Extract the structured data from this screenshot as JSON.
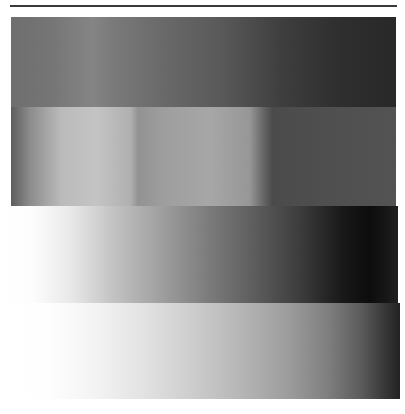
{
  "image": {
    "title": "Grayscale gradient test pattern",
    "width": 405,
    "height": 414,
    "background_color": "#ffffff",
    "type": "grayscale-gradient-bands",
    "band_count": 4,
    "rule": {
      "name": "top-horizontal-rule",
      "color": "#3a3a3a",
      "x": 10,
      "y": 5,
      "width": 387,
      "height": 2
    }
  },
  "chart_data": {
    "type": "heatmap",
    "subtitle": "Four horizontal luminance ramp bands",
    "xlabel": "",
    "ylabel": "",
    "grid": false,
    "legend": "none",
    "xlim": [
      0,
      405
    ],
    "ylim": [
      0,
      414
    ],
    "colormap": "grayscale",
    "value_range": [
      0,
      255
    ],
    "note": "Values are 8-bit luminance sampled left-to-right across each band.",
    "bands": [
      {
        "name": "band-1",
        "index": 1,
        "x": 11,
        "y": 17,
        "width": 385,
        "height": 90,
        "direction": "horizontal",
        "stops": [
          {
            "pos_pct": 0,
            "x": 11,
            "gray": 110,
            "hex": "#6e6e6e"
          },
          {
            "pos_pct": 10,
            "x": 50,
            "gray": 116,
            "hex": "#747474"
          },
          {
            "pos_pct": 21,
            "x": 92,
            "gray": 132,
            "hex": "#848484"
          },
          {
            "pos_pct": 26,
            "x": 110,
            "gray": 122,
            "hex": "#7a7a7a"
          },
          {
            "pos_pct": 40,
            "x": 165,
            "gray": 104,
            "hex": "#686868"
          },
          {
            "pos_pct": 55,
            "x": 223,
            "gray": 88,
            "hex": "#585858"
          },
          {
            "pos_pct": 70,
            "x": 280,
            "gray": 62,
            "hex": "#3e3e3e"
          },
          {
            "pos_pct": 85,
            "x": 338,
            "gray": 46,
            "hex": "#2e2e2e"
          },
          {
            "pos_pct": 100,
            "x": 396,
            "gray": 40,
            "hex": "#282828"
          }
        ]
      },
      {
        "name": "band-2",
        "index": 2,
        "x": 11,
        "y": 107,
        "width": 385,
        "height": 99,
        "direction": "horizontal",
        "stops": [
          {
            "pos_pct": 0,
            "x": 11,
            "gray": 92,
            "hex": "#5c5c5c"
          },
          {
            "pos_pct": 5,
            "x": 30,
            "gray": 140,
            "hex": "#8c8c8c"
          },
          {
            "pos_pct": 13,
            "x": 61,
            "gray": 186,
            "hex": "#bababa"
          },
          {
            "pos_pct": 22,
            "x": 96,
            "gray": 196,
            "hex": "#c4c4c4"
          },
          {
            "pos_pct": 31,
            "x": 131,
            "gray": 176,
            "hex": "#b0b0b0"
          },
          {
            "pos_pct": 33,
            "x": 138,
            "gray": 146,
            "hex": "#929292"
          },
          {
            "pos_pct": 40,
            "x": 165,
            "gray": 158,
            "hex": "#9e9e9e"
          },
          {
            "pos_pct": 52,
            "x": 211,
            "gray": 166,
            "hex": "#a6a6a6"
          },
          {
            "pos_pct": 62,
            "x": 250,
            "gray": 150,
            "hex": "#969696"
          },
          {
            "pos_pct": 66,
            "x": 265,
            "gray": 96,
            "hex": "#606060"
          },
          {
            "pos_pct": 68,
            "x": 273,
            "gray": 74,
            "hex": "#4a4a4a"
          },
          {
            "pos_pct": 80,
            "x": 319,
            "gray": 78,
            "hex": "#4e4e4e"
          },
          {
            "pos_pct": 100,
            "x": 396,
            "gray": 82,
            "hex": "#525252"
          }
        ]
      },
      {
        "name": "band-3",
        "index": 3,
        "x": 0,
        "y": 206,
        "width": 398,
        "height": 97,
        "direction": "horizontal",
        "stops": [
          {
            "pos_pct": 0,
            "x": 0,
            "gray": 255,
            "hex": "#ffffff"
          },
          {
            "pos_pct": 8,
            "x": 32,
            "gray": 253,
            "hex": "#fdfdfd"
          },
          {
            "pos_pct": 18,
            "x": 72,
            "gray": 232,
            "hex": "#e8e8e8"
          },
          {
            "pos_pct": 28,
            "x": 111,
            "gray": 196,
            "hex": "#c4c4c4"
          },
          {
            "pos_pct": 40,
            "x": 159,
            "gray": 160,
            "hex": "#a0a0a0"
          },
          {
            "pos_pct": 52,
            "x": 207,
            "gray": 124,
            "hex": "#7c7c7c"
          },
          {
            "pos_pct": 64,
            "x": 255,
            "gray": 92,
            "hex": "#5c5c5c"
          },
          {
            "pos_pct": 76,
            "x": 302,
            "gray": 58,
            "hex": "#3a3a3a"
          },
          {
            "pos_pct": 86,
            "x": 342,
            "gray": 24,
            "hex": "#181818"
          },
          {
            "pos_pct": 93,
            "x": 370,
            "gray": 12,
            "hex": "#0c0c0c"
          },
          {
            "pos_pct": 100,
            "x": 398,
            "gray": 30,
            "hex": "#1e1e1e"
          }
        ]
      },
      {
        "name": "band-4",
        "index": 4,
        "x": 0,
        "y": 303,
        "width": 400,
        "height": 96,
        "direction": "horizontal",
        "stops": [
          {
            "pos_pct": 0,
            "x": 0,
            "gray": 255,
            "hex": "#ffffff"
          },
          {
            "pos_pct": 12,
            "x": 48,
            "gray": 254,
            "hex": "#fefefe"
          },
          {
            "pos_pct": 24,
            "x": 96,
            "gray": 243,
            "hex": "#f3f3f3"
          },
          {
            "pos_pct": 36,
            "x": 144,
            "gray": 226,
            "hex": "#e2e2e2"
          },
          {
            "pos_pct": 48,
            "x": 192,
            "gray": 205,
            "hex": "#cdcdcd"
          },
          {
            "pos_pct": 60,
            "x": 240,
            "gray": 182,
            "hex": "#b6b6b6"
          },
          {
            "pos_pct": 72,
            "x": 288,
            "gray": 156,
            "hex": "#9c9c9c"
          },
          {
            "pos_pct": 82,
            "x": 328,
            "gray": 126,
            "hex": "#7e7e7e"
          },
          {
            "pos_pct": 90,
            "x": 360,
            "gray": 92,
            "hex": "#5c5c5c"
          },
          {
            "pos_pct": 96,
            "x": 384,
            "gray": 56,
            "hex": "#383838"
          },
          {
            "pos_pct": 100,
            "x": 400,
            "gray": 34,
            "hex": "#222222"
          }
        ]
      }
    ]
  }
}
